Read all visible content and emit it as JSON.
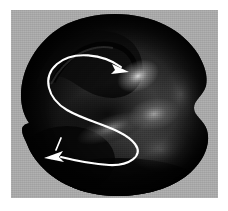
{
  "figure": {
    "kind": "grayscale-micrograph",
    "caption_text": "",
    "background_color": "#ffffff",
    "plate": {
      "background_color": "#a8a8a8",
      "left": 11,
      "top": 10,
      "width": 207,
      "height": 188
    },
    "specimen": {
      "name": "dark-rounded-specimen",
      "fill_dark": "#050505",
      "fill_mid": "#2b2b2b",
      "fill_light": "#6e6e6e",
      "description": "dark near-circular body with lobed upper-left ridge, a right-side bulge and a small lower-left protrusion"
    },
    "annotation": {
      "stroke_color": "#ffffff",
      "path_label": "s-shaped-flow-path",
      "stroke_width": 2.1,
      "arrow_top": {
        "name": "arrowhead-right",
        "direction": "right",
        "tip_x": 118,
        "tip_y": 62
      },
      "arrow_bottom": {
        "name": "arrowhead-left",
        "direction": "left",
        "tip_x": 44,
        "tip_y": 146
      },
      "tick_mark": {
        "name": "short-tick-mark",
        "x": 47,
        "y": 134
      }
    },
    "highlights": [
      {
        "name": "highlight-upper-right",
        "cx": 127,
        "cy": 66,
        "color": "#c9c9c9"
      },
      {
        "name": "highlight-center-right",
        "cx": 143,
        "cy": 104,
        "color": "#9a9a9a"
      },
      {
        "name": "highlight-mid-band",
        "cx": 100,
        "cy": 118,
        "color": "#8a8a8a"
      },
      {
        "name": "highlight-lower-right",
        "cx": 150,
        "cy": 140,
        "color": "#5a5a5a"
      }
    ]
  }
}
